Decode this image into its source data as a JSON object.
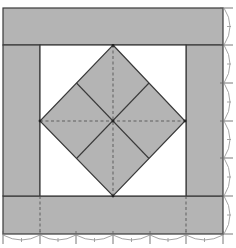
{
  "figure": {
    "title": "Square-in-a-square quilt block with border bands",
    "colors": {
      "background": "#ffffff",
      "fill": "#b4b4b4",
      "outline": "#3a3a3a",
      "seam_dashed": "#555555",
      "measure_arcs": "#8c8c8c"
    },
    "frame": {
      "x0": 3,
      "y0": 8,
      "x1": 223,
      "y1": 234
    },
    "bands": {
      "top": {
        "x": 3,
        "y": 8,
        "w": 220,
        "h": 37
      },
      "bottom": {
        "x": 3,
        "y": 196,
        "w": 220,
        "h": 38
      },
      "left": {
        "x": 3,
        "y": 45,
        "w": 37,
        "h": 151
      },
      "right": {
        "x": 186,
        "y": 45,
        "w": 37,
        "h": 151
      }
    },
    "inner_square": {
      "x": 40,
      "y": 45,
      "w": 146,
      "h": 151
    },
    "diamond": {
      "top": [
        113,
        45
      ],
      "right": [
        185,
        121
      ],
      "bottom": [
        113,
        196
      ],
      "left": [
        40,
        121
      ],
      "center": [
        113,
        121
      ]
    },
    "bottom_ticks_x": [
      3,
      40,
      76,
      113,
      150,
      186,
      223
    ],
    "right_ticks_y": [
      8,
      45,
      83,
      121,
      158,
      196,
      234
    ]
  }
}
